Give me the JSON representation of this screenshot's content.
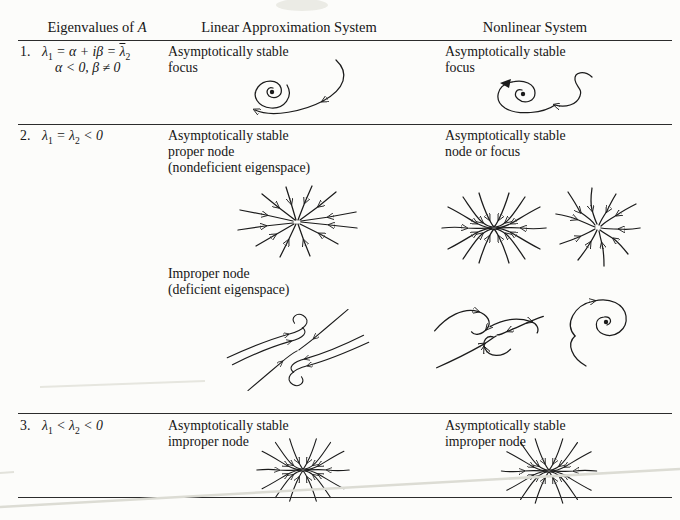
{
  "page": {
    "background": "#fcfcfa",
    "ink": "#161616",
    "rule_color": "#2c2c2c"
  },
  "header": {
    "col1_text": "Eigenvalues of ",
    "col1_math": "A",
    "col2": "Linear Approximation System",
    "col3": "Nonlinear System"
  },
  "rows": {
    "r1": {
      "num": "1.",
      "eig": {
        "a": "λ",
        "a_sub": "1",
        "b": " = ",
        "c": "α + iβ",
        "d": " = ",
        "g": "λ",
        "g_sub": "2",
        "line2": "α < 0, β ≠ 0"
      },
      "linear": {
        "l1": "Asymptotically stable",
        "l2": "focus",
        "diagram": "spiral trajectory converging to a point"
      },
      "nonlinear": {
        "l1": "Asymptotically stable",
        "l2": "focus",
        "diagram": "wavy spiral trajectory converging to a point"
      }
    },
    "r2": {
      "num": "2.",
      "eig": {
        "a": "λ",
        "a_sub": "1",
        "b": " = ",
        "c": "λ",
        "c_sub": "2",
        "d": " < 0"
      },
      "linear": {
        "l1": "Asymptotically stable",
        "l2": "proper node",
        "l3": "(nondeficient eigenspace)",
        "diagram": "star of straight rays with inward arrows"
      },
      "nonlinear": {
        "l1": "Asymptotically stable",
        "l2": "node or focus",
        "diagram1": "curved trajectories converging to a node",
        "diagram2": "curved star converging to center"
      },
      "sub_linear": {
        "l1": "Improper node",
        "l2": "(deficient eigenspace)",
        "diagram": "eigenline with S-shaped tangent trajectories"
      },
      "sub_nonlinear": {
        "diagram1": "wavy deficient-node trajectories",
        "diagram2": "small spiral with tail"
      }
    },
    "r3": {
      "num": "3.",
      "eig": {
        "a": "λ",
        "a_sub": "1",
        "b": " < ",
        "c": "λ",
        "c_sub": "2",
        "d": " < 0"
      },
      "linear": {
        "l1": "Asymptotically stable",
        "l2": "improper node",
        "diagram": "trajectories converging along horizontal axis"
      },
      "nonlinear": {
        "l1": "Asymptotically stable",
        "l2": "improper node",
        "diagram": "trajectories converging along horizontal axis (mirrored)"
      }
    }
  }
}
